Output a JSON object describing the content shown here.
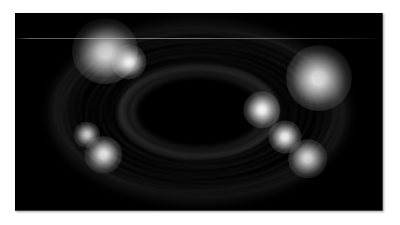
{
  "page": {
    "background_color": "#ffffff",
    "width": 400,
    "height": 225
  },
  "plate": {
    "label": "planetary-ring-system-photograph",
    "background_color": "#000000",
    "left": 15,
    "top": 13,
    "width": 368,
    "height": 198,
    "color_mode": "grayscale"
  },
  "image_content": {
    "subject": "planetary ring system",
    "description": "Grayscale astronomical image of a broad, inclined system of concentric elliptical rings surrounding a dark elliptical central void, with several bright knots along the ring arcs.",
    "orientation": "inclined ellipse, major axis horizontal",
    "center_x_pct": 50,
    "center_y_pct": 50,
    "faint_scan_line_y": 25,
    "faint_scan_line_color": "#bebebe"
  },
  "chart_data": {
    "type": "heatmap",
    "title": "",
    "xlabel": "",
    "ylabel": "",
    "grid": false,
    "legend_position": "none",
    "colormap": "grayscale",
    "value_range": [
      0,
      255
    ],
    "rings": [
      {
        "name": "outer-halo",
        "semi_major_px": 150,
        "semi_minor_px": 91,
        "brightness": 42,
        "blur_px": 5.0
      },
      {
        "name": "a-ring-outer",
        "semi_major_px": 141,
        "semi_minor_px": 85,
        "brightness": 232,
        "blur_px": 1.6
      },
      {
        "name": "a-ring-inner",
        "semi_major_px": 132,
        "semi_minor_px": 79,
        "brightness": 196,
        "blur_px": 2.0
      },
      {
        "name": "cassini-division",
        "semi_major_px": 124,
        "semi_minor_px": 74,
        "brightness": 14,
        "blur_px": 2.0
      },
      {
        "name": "b-ring-outer",
        "semi_major_px": 118,
        "semi_minor_px": 70,
        "brightness": 228,
        "blur_px": 1.8
      },
      {
        "name": "b-ring-mid",
        "semi_major_px": 107,
        "semi_minor_px": 63,
        "brightness": 214,
        "blur_px": 2.2
      },
      {
        "name": "b-ring-inner",
        "semi_major_px": 98,
        "semi_minor_px": 57,
        "brightness": 186,
        "blur_px": 2.4
      },
      {
        "name": "inner-dark-lane",
        "semi_major_px": 88,
        "semi_minor_px": 50,
        "brightness": 16,
        "blur_px": 2.6
      },
      {
        "name": "c-ring-outer",
        "semi_major_px": 80,
        "semi_minor_px": 46,
        "brightness": 226,
        "blur_px": 2.2
      },
      {
        "name": "c-ring-inner",
        "semi_major_px": 69,
        "semi_minor_px": 39,
        "brightness": 214,
        "blur_px": 2.6
      },
      {
        "name": "central-void",
        "semi_major_px": 64,
        "semi_minor_px": 35,
        "brightness": 0,
        "blur_px": 5.0
      }
    ],
    "knots": [
      {
        "name": "knot-upper-left",
        "x_pct": 24.5,
        "y_pct": 19.0,
        "size_px": 30,
        "brightness": 255
      },
      {
        "name": "knot-upper-left-inner",
        "x_pct": 31.0,
        "y_pct": 24.5,
        "size_px": 16,
        "brightness": 238
      },
      {
        "name": "knot-right",
        "x_pct": 82.5,
        "y_pct": 33.0,
        "size_px": 30,
        "brightness": 255
      },
      {
        "name": "knot-right-inner",
        "x_pct": 67.0,
        "y_pct": 49.0,
        "size_px": 17,
        "brightness": 244
      },
      {
        "name": "knot-lower-right",
        "x_pct": 73.5,
        "y_pct": 62.5,
        "size_px": 15,
        "brightness": 238
      },
      {
        "name": "knot-lower-right-outer",
        "x_pct": 79.5,
        "y_pct": 73.5,
        "size_px": 18,
        "brightness": 250
      },
      {
        "name": "knot-lower-left",
        "x_pct": 24.0,
        "y_pct": 71.5,
        "size_px": 17,
        "brightness": 240
      },
      {
        "name": "knot-left-inner",
        "x_pct": 19.5,
        "y_pct": 61.5,
        "size_px": 12,
        "brightness": 210
      }
    ],
    "streak_count": 22,
    "streaks_note": "Faint azimuthal trailed arcs overlaying the ring bands"
  },
  "accessibility": {
    "alt_text": "Black-and-white astronomical photograph of a planetary ring system seen at an inclined angle, showing many concentric elliptical ring bands with bright knots and a dark elliptical centre."
  }
}
